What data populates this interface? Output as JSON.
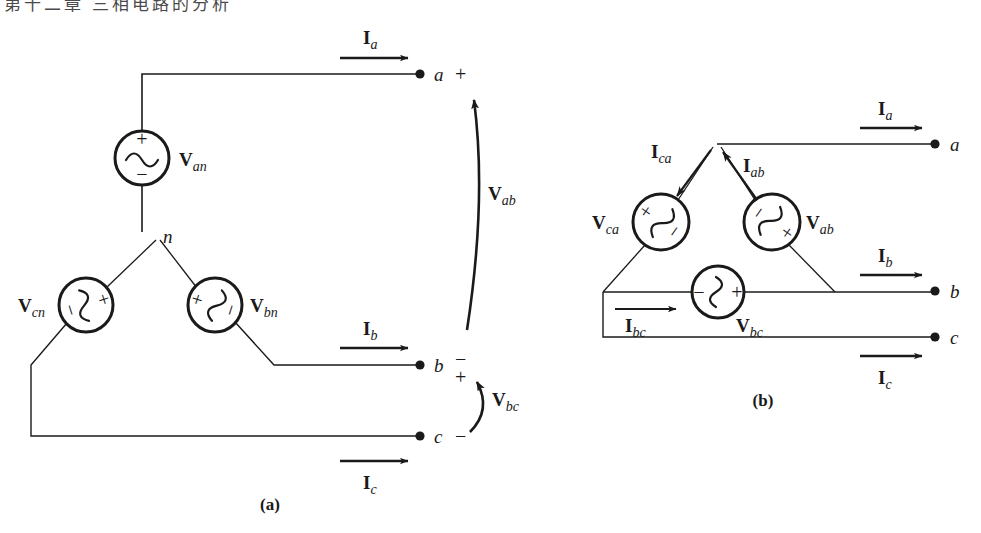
{
  "page": {
    "width": 981,
    "height": 533,
    "background": "#ffffff",
    "line_color": "#1a1a1a",
    "text_color": "#1a1a1a",
    "cropped_header_text": "第十二章  三相电路的分析"
  },
  "figure": {
    "caption_a": "(a)",
    "caption_b": "(b)",
    "subfigures": [
      {
        "id": "a",
        "name": "wye-connected-source",
        "caption": "(a)",
        "neutral_label": "n",
        "sources": [
          {
            "name": "Van",
            "label_bold": "V",
            "label_sub": "an",
            "plus": "+",
            "minus": "−",
            "orientation": "vertical",
            "cx": 142,
            "cy": 158,
            "r": 27
          },
          {
            "name": "Vcn",
            "label_bold": "V",
            "label_sub": "cn",
            "plus": "+",
            "minus": "−",
            "orientation": "rotated",
            "cx": 86,
            "cy": 305,
            "r": 27
          },
          {
            "name": "Vbn",
            "label_bold": "V",
            "label_sub": "bn",
            "plus": "+",
            "minus": "−",
            "orientation": "rotated",
            "cx": 215,
            "cy": 305,
            "r": 27
          }
        ],
        "terminals": [
          {
            "letter": "a",
            "sign": "+",
            "x": 420,
            "y": 74
          },
          {
            "letter": "b",
            "sign_top": "−",
            "sign_bottom": "+",
            "x": 420,
            "y": 365
          },
          {
            "letter": "c",
            "sign": "−",
            "x": 420,
            "y": 436
          }
        ],
        "line_currents": [
          {
            "label_bold": "I",
            "label_sub": "a",
            "name": "Ia",
            "x": 380,
            "y": 45
          },
          {
            "label_bold": "I",
            "label_sub": "b",
            "name": "Ib",
            "x": 380,
            "y": 336
          },
          {
            "label_bold": "I",
            "label_sub": "c",
            "name": "Ic",
            "x": 380,
            "y": 478
          }
        ],
        "line_voltages": [
          {
            "label_bold": "V",
            "label_sub": "ab",
            "name": "Vab",
            "x": 492,
            "y": 192
          },
          {
            "label_bold": "V",
            "label_sub": "bc",
            "name": "Vbc",
            "x": 492,
            "y": 400
          }
        ]
      },
      {
        "id": "b",
        "name": "delta-connected-source",
        "caption": "(b)",
        "sources": [
          {
            "name": "Vca",
            "label_bold": "V",
            "label_sub": "ca",
            "plus": "+",
            "minus": "−",
            "orientation": "rotated",
            "cx": 661,
            "cy": 222,
            "r": 28
          },
          {
            "name": "Vab",
            "label_bold": "V",
            "label_sub": "ab",
            "plus": "+",
            "minus": "−",
            "orientation": "rotated",
            "cx": 772,
            "cy": 222,
            "r": 28
          },
          {
            "name": "Vbc",
            "label_bold": "V",
            "label_sub": "bc",
            "plus": "+",
            "minus": "−",
            "orientation": "horizontal",
            "cx": 718,
            "cy": 292,
            "r": 26
          }
        ],
        "terminals": [
          {
            "letter": "a",
            "x": 935,
            "y": 144
          },
          {
            "letter": "b",
            "x": 935,
            "y": 291
          },
          {
            "letter": "c",
            "x": 935,
            "y": 337
          }
        ],
        "line_currents": [
          {
            "label_bold": "I",
            "label_sub": "a",
            "name": "Ia",
            "x": 886,
            "y": 115
          },
          {
            "label_bold": "I",
            "label_sub": "b",
            "name": "Ib",
            "x": 886,
            "y": 262
          },
          {
            "label_bold": "I",
            "label_sub": "c",
            "name": "Ic",
            "x": 886,
            "y": 378
          }
        ],
        "phase_currents": [
          {
            "label_bold": "I",
            "label_sub": "ca",
            "name": "Ica",
            "x": 664,
            "y": 152
          },
          {
            "label_bold": "I",
            "label_sub": "ab",
            "name": "Iab",
            "x": 748,
            "y": 163
          },
          {
            "label_bold": "I",
            "label_sub": "bc",
            "name": "Ibc",
            "x": 643,
            "y": 326
          }
        ]
      }
    ]
  }
}
